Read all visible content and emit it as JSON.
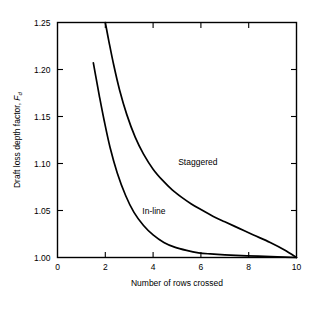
{
  "chart_data": {
    "type": "line",
    "title": "",
    "subtitle": "",
    "xlabel": "Number of rows crossed",
    "ylabel": "Draft loss depth factor, F",
    "ylabel_subscript": "d",
    "xlim": [
      0,
      10
    ],
    "ylim": [
      1.0,
      1.25
    ],
    "xticks": [
      0,
      2,
      4,
      6,
      8,
      10
    ],
    "xtick_labels": [
      "0",
      "2",
      "4",
      "6",
      "8",
      "10"
    ],
    "yticks": [
      1.0,
      1.05,
      1.1,
      1.15,
      1.2,
      1.25
    ],
    "ytick_labels": [
      "1.00",
      "1.05",
      "1.10",
      "1.15",
      "1.20",
      "1.25"
    ],
    "grid": false,
    "legend_position": "inline-annotation",
    "line_color": "#000000",
    "frame_color": "#000000",
    "background": "#ffffff",
    "series": [
      {
        "name": "Staggered",
        "label": "Staggered",
        "label_x": 5.05,
        "label_y": 1.098,
        "x": [
          2.0,
          2.15,
          2.35,
          2.6,
          2.9,
          3.25,
          3.6,
          4.0,
          4.4,
          4.8,
          5.2,
          5.6,
          6.0,
          6.5,
          7.0,
          7.6,
          8.2,
          8.9,
          9.5,
          10.0
        ],
        "values": [
          1.25,
          1.23,
          1.205,
          1.178,
          1.152,
          1.128,
          1.11,
          1.094,
          1.082,
          1.072,
          1.064,
          1.057,
          1.051,
          1.044,
          1.038,
          1.031,
          1.024,
          1.016,
          1.008,
          1.0
        ]
      },
      {
        "name": "In-line",
        "label": "In-line",
        "label_x": 3.55,
        "label_y": 1.046,
        "x": [
          1.5,
          1.6,
          1.75,
          1.95,
          2.2,
          2.5,
          2.85,
          3.2,
          3.6,
          4.0,
          4.45,
          4.9,
          5.4,
          5.9,
          6.4,
          7.0,
          7.7,
          8.4,
          9.2,
          10.0
        ],
        "values": [
          1.207,
          1.193,
          1.172,
          1.146,
          1.117,
          1.09,
          1.066,
          1.048,
          1.034,
          1.024,
          1.016,
          1.011,
          1.0075,
          1.005,
          1.0038,
          1.0028,
          1.002,
          1.0014,
          1.0007,
          1.0
        ]
      }
    ]
  }
}
